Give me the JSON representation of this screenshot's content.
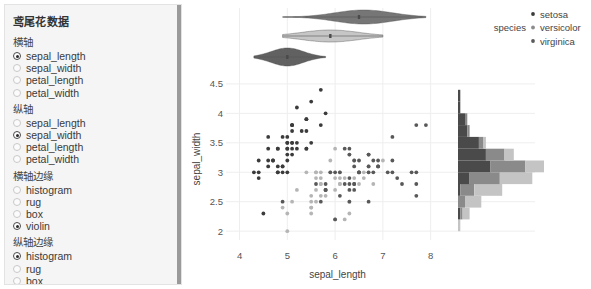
{
  "sidebar": {
    "title": "鸢尾花数据",
    "groups": [
      {
        "name": "x-axis",
        "label": "横轴",
        "options": [
          {
            "label": "sepal_length",
            "selected": true
          },
          {
            "label": "sepal_width",
            "selected": false
          },
          {
            "label": "petal_length",
            "selected": false
          },
          {
            "label": "petal_width",
            "selected": false
          }
        ]
      },
      {
        "name": "y-axis",
        "label": "纵轴",
        "options": [
          {
            "label": "sepal_length",
            "selected": false
          },
          {
            "label": "sepal_width",
            "selected": true
          },
          {
            "label": "petal_length",
            "selected": false
          },
          {
            "label": "petal_width",
            "selected": false
          }
        ]
      },
      {
        "name": "x-marginal",
        "label": "横轴边缘",
        "options": [
          {
            "label": "histogram",
            "selected": false
          },
          {
            "label": "rug",
            "selected": false
          },
          {
            "label": "box",
            "selected": false
          },
          {
            "label": "violin",
            "selected": true
          }
        ]
      },
      {
        "name": "y-marginal",
        "label": "纵轴边缘",
        "options": [
          {
            "label": "histogram",
            "selected": true
          },
          {
            "label": "rug",
            "selected": false
          },
          {
            "label": "box",
            "selected": false
          },
          {
            "label": "violin",
            "selected": false
          }
        ]
      }
    ]
  },
  "legend": {
    "title": "species",
    "entries": [
      {
        "label": "setosa",
        "color": "#3b3b3b"
      },
      {
        "label": "versicolor",
        "color": "#8c8c8c"
      },
      {
        "label": "virginica",
        "color": "#5a5a5a"
      }
    ]
  },
  "chart_data": {
    "type": "scatter",
    "title": "",
    "xlabel": "sepal_length",
    "ylabel": "sepal_width",
    "xlim": [
      3.8,
      8.3
    ],
    "ylim": [
      1.85,
      4.6
    ],
    "xticks": [
      4,
      5,
      6,
      7,
      8
    ],
    "yticks": [
      2,
      2.5,
      3,
      3.5,
      4,
      4.5
    ],
    "grid": true,
    "legend_position": "top-right",
    "color_by": "species",
    "series": [
      {
        "name": "setosa",
        "color": "#3b3b3b",
        "x": [
          5.1,
          4.9,
          4.7,
          4.6,
          5.0,
          5.4,
          4.6,
          5.0,
          4.4,
          4.9,
          5.4,
          4.8,
          4.8,
          4.3,
          5.8,
          5.7,
          5.4,
          5.1,
          5.7,
          5.1,
          5.4,
          5.1,
          4.6,
          5.1,
          4.8,
          5.0,
          5.0,
          5.2,
          5.2,
          4.7,
          4.8,
          5.4,
          5.2,
          5.5,
          4.9,
          5.0,
          5.5,
          4.9,
          4.4,
          5.1,
          5.0,
          4.5,
          4.4,
          5.0,
          5.1,
          4.8,
          5.1,
          4.6,
          5.3,
          5.0
        ],
        "y": [
          3.5,
          3.0,
          3.2,
          3.1,
          3.6,
          3.9,
          3.4,
          3.4,
          2.9,
          3.1,
          3.7,
          3.4,
          3.0,
          3.0,
          4.0,
          4.4,
          3.9,
          3.5,
          3.8,
          3.8,
          3.4,
          3.7,
          3.6,
          3.3,
          3.4,
          3.0,
          3.4,
          3.5,
          3.4,
          3.2,
          3.1,
          3.4,
          4.1,
          4.2,
          3.1,
          3.2,
          3.5,
          3.6,
          3.0,
          3.4,
          3.5,
          2.3,
          3.2,
          3.5,
          3.8,
          3.0,
          3.8,
          3.2,
          3.7,
          3.3
        ]
      },
      {
        "name": "versicolor",
        "color": "#b5b5b5",
        "x": [
          7.0,
          6.4,
          6.9,
          5.5,
          6.5,
          5.7,
          6.3,
          4.9,
          6.6,
          5.2,
          5.0,
          5.9,
          6.0,
          6.1,
          5.6,
          6.7,
          5.6,
          5.8,
          6.2,
          5.6,
          5.9,
          6.1,
          6.3,
          6.1,
          6.4,
          6.6,
          6.8,
          6.7,
          6.0,
          5.7,
          5.5,
          5.5,
          5.8,
          6.0,
          5.4,
          6.0,
          6.7,
          6.3,
          5.6,
          5.5,
          5.5,
          6.1,
          5.8,
          5.0,
          5.6,
          5.7,
          5.7,
          6.2,
          5.1,
          5.7
        ],
        "y": [
          3.2,
          3.2,
          3.1,
          2.3,
          2.8,
          2.8,
          3.3,
          2.4,
          2.9,
          2.7,
          2.0,
          3.0,
          2.2,
          2.9,
          2.9,
          3.1,
          3.0,
          2.7,
          2.2,
          2.5,
          3.2,
          2.8,
          2.5,
          2.8,
          2.9,
          3.0,
          2.8,
          3.0,
          2.9,
          2.6,
          2.4,
          2.4,
          2.7,
          2.7,
          3.0,
          3.4,
          3.1,
          2.3,
          3.0,
          2.5,
          2.6,
          3.0,
          2.6,
          2.3,
          2.7,
          3.0,
          2.9,
          2.9,
          2.5,
          2.8
        ]
      },
      {
        "name": "virginica",
        "color": "#585858",
        "x": [
          6.3,
          5.8,
          7.1,
          6.3,
          6.5,
          7.6,
          4.9,
          7.3,
          6.7,
          7.2,
          6.5,
          6.4,
          6.8,
          5.7,
          5.8,
          6.4,
          6.5,
          7.7,
          7.7,
          6.0,
          6.9,
          5.6,
          7.7,
          6.3,
          6.7,
          7.2,
          6.2,
          6.1,
          6.4,
          7.2,
          7.4,
          7.9,
          6.4,
          6.3,
          6.1,
          7.7,
          6.3,
          6.4,
          6.0,
          6.9,
          6.7,
          6.9,
          5.8,
          6.8,
          6.7,
          6.7,
          6.3,
          6.5,
          6.2,
          5.9
        ],
        "y": [
          3.3,
          2.7,
          3.0,
          2.9,
          3.0,
          3.0,
          2.5,
          2.9,
          2.5,
          3.6,
          3.2,
          2.7,
          3.0,
          2.5,
          2.8,
          3.2,
          3.0,
          3.8,
          2.6,
          2.2,
          3.2,
          2.8,
          2.8,
          2.7,
          3.3,
          3.2,
          2.8,
          3.0,
          2.8,
          3.0,
          2.8,
          3.8,
          2.8,
          2.8,
          2.6,
          3.0,
          3.4,
          3.1,
          3.0,
          3.1,
          3.1,
          3.1,
          2.7,
          3.2,
          3.3,
          3.0,
          2.5,
          3.0,
          3.4,
          3.0
        ]
      }
    ],
    "x_marginal": {
      "type": "violin",
      "series": [
        {
          "name": "setosa",
          "color": "#545454",
          "center": 5.0,
          "min": 4.3,
          "max": 5.8,
          "q1": 4.8,
          "q3": 5.2,
          "median": 5.0
        },
        {
          "name": "versicolor",
          "color": "#c2c2c2",
          "center": 5.9,
          "min": 4.9,
          "max": 7.0,
          "q1": 5.6,
          "q3": 6.3,
          "median": 5.9
        },
        {
          "name": "virginica",
          "color": "#6b6b6b",
          "center": 6.6,
          "min": 4.9,
          "max": 7.9,
          "q1": 6.2,
          "q3": 6.9,
          "median": 6.5
        }
      ]
    },
    "y_marginal": {
      "type": "histogram",
      "bins": [
        2.0,
        2.2,
        2.4,
        2.6,
        2.8,
        3.0,
        3.2,
        3.4,
        3.6,
        3.8,
        4.0,
        4.2,
        4.4
      ],
      "series": [
        {
          "name": "setosa",
          "color": "#4a4a4a",
          "counts": [
            0,
            1,
            0,
            1,
            5,
            14,
            12,
            9,
            4,
            3,
            1,
            1
          ]
        },
        {
          "name": "versicolor",
          "color": "#c4c4c4",
          "counts": [
            1,
            3,
            7,
            12,
            14,
            8,
            4,
            1,
            0,
            0,
            0,
            0
          ]
        },
        {
          "name": "virginica",
          "color": "#8a8a8a",
          "counts": [
            0,
            1,
            3,
            6,
            13,
            15,
            8,
            2,
            1,
            1,
            0,
            0
          ]
        }
      ]
    }
  }
}
